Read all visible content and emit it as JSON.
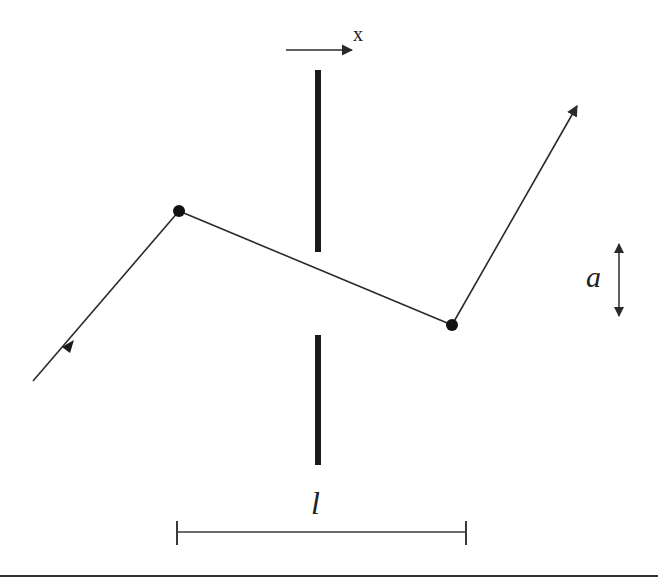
{
  "diagram": {
    "labels": {
      "x_axis": "x",
      "displacement": "a",
      "length": "l"
    },
    "colors": {
      "line": "#2a2a2a",
      "barrier": "#1a1a1a",
      "background": "#ffffff"
    },
    "path_points": [
      {
        "x": 33,
        "y": 381
      },
      {
        "x": 179,
        "y": 211
      },
      {
        "x": 452,
        "y": 325
      },
      {
        "x": 578,
        "y": 104
      }
    ],
    "nodes": [
      {
        "x": 179,
        "y": 211
      },
      {
        "x": 452,
        "y": 325
      }
    ],
    "barrier": {
      "x": 318,
      "upper": {
        "y1": 70,
        "y2": 252
      },
      "lower": {
        "y1": 335,
        "y2": 465
      }
    },
    "length_bar": {
      "x1": 177,
      "x2": 466,
      "y": 532
    },
    "displacement_arrow": {
      "x": 619,
      "y1": 244,
      "y2": 316
    },
    "x_arrow": {
      "x1": 286,
      "x2": 350,
      "y": 50
    }
  }
}
